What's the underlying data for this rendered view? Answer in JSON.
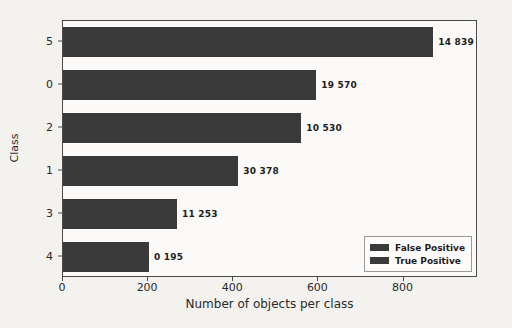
{
  "chart_data": {
    "type": "bar",
    "orientation": "horizontal",
    "title": "",
    "xlabel": "Number of objects per class",
    "ylabel": "Class",
    "categories": [
      "5",
      "0",
      "2",
      "1",
      "3",
      "4"
    ],
    "values": [
      870,
      595,
      560,
      412,
      268,
      202
    ],
    "data_labels": [
      "14 839",
      "19 570",
      "10 530",
      "30 378",
      "11 253",
      "0 195"
    ],
    "xlim": [
      0,
      975
    ],
    "ylim": [
      -0.5,
      5.5
    ],
    "xticks": [
      0,
      200,
      400,
      600,
      800
    ],
    "xticklabels": [
      "0",
      "200",
      "400",
      "600",
      "800"
    ],
    "grid": false,
    "legend": {
      "position": "lower right",
      "entries": [
        {
          "name": "False Positive",
          "color": "#3a3a3a"
        },
        {
          "name": "True Positive",
          "color": "#3a3a3a"
        }
      ]
    },
    "series": [
      {
        "name": "True Positive",
        "color": "#3a3a3a",
        "values": [
          870,
          595,
          560,
          412,
          268,
          202
        ]
      }
    ]
  },
  "colors": {
    "bar": "#3a3a3a",
    "axis": "#4a4a4a",
    "text": "#2a2a2a",
    "background": "#f3f2ef",
    "plot_background": "#fbfaf8"
  }
}
